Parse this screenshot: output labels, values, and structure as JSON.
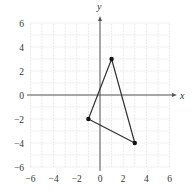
{
  "chart_data": {
    "type": "scatter",
    "title": "",
    "xlabel": "x",
    "ylabel": "y",
    "xlim": [
      -6,
      6
    ],
    "ylim": [
      -6,
      6
    ],
    "grid": true,
    "grid_step": 1,
    "x_ticks": [
      -6,
      -4,
      -2,
      0,
      2,
      4,
      6
    ],
    "y_ticks": [
      -6,
      -4,
      -2,
      0,
      2,
      4,
      6
    ],
    "x_tick_labels": [
      "−6",
      "−4",
      "−2",
      "0",
      "2",
      "4",
      "6"
    ],
    "y_tick_labels": [
      "−6",
      "−4",
      "−2",
      "0",
      "2",
      "4",
      "6"
    ],
    "series": [
      {
        "name": "triangle",
        "closed": true,
        "points": [
          {
            "x": 1,
            "y": 3
          },
          {
            "x": -1,
            "y": -2
          },
          {
            "x": 3,
            "y": -4
          }
        ]
      }
    ],
    "legend": null
  },
  "colors": {
    "axis": "#555555",
    "grid": "#e6e6e6",
    "shape": "#333333",
    "vertex": "#111111",
    "text": "#333333"
  },
  "layout": {
    "origin_px": [
      100,
      95
    ],
    "unit_px_x": 11.6,
    "unit_px_y": 12
  }
}
